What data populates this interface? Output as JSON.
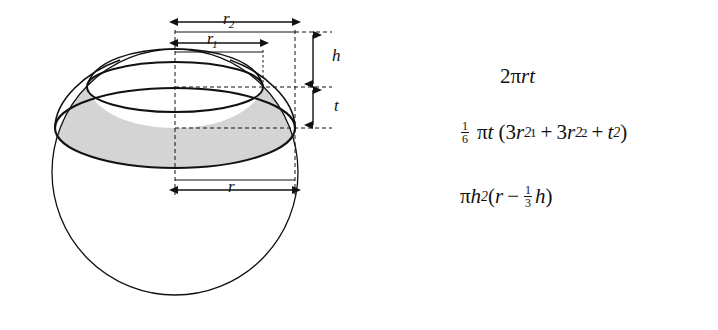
{
  "figure": {
    "background_color": "#ffffff",
    "ink_color": "#111111",
    "shade_color": "#d4d4d4"
  },
  "diagram": {
    "name": "sphere-zone-diagram",
    "sphere": {
      "center_x": 175,
      "center_y": 172,
      "radius": 123
    },
    "upper_circle": {
      "label": "r1",
      "center_x": 175,
      "center_y": 87,
      "semi_major": 88,
      "semi_minor": 25
    },
    "lower_circle": {
      "label": "r2",
      "center_x": 175,
      "center_y": 128,
      "semi_major": 120,
      "semi_minor": 40
    },
    "dimensions": [
      {
        "id": "r2",
        "label": "r",
        "subscript": "2",
        "orientation": "horizontal",
        "y": 22,
        "x_start": 178,
        "x_end": 296
      },
      {
        "id": "r1",
        "label": "r",
        "subscript": "1",
        "orientation": "horizontal",
        "y": 43,
        "x_start": 178,
        "x_end": 264
      },
      {
        "id": "h",
        "label": "h",
        "subscript": "",
        "orientation": "vertical",
        "x": 313,
        "y_start": 52,
        "y_end": 107
      },
      {
        "id": "t",
        "label": "t",
        "subscript": "",
        "orientation": "vertical",
        "x": 313,
        "y_start": 107,
        "y_end": 155
      },
      {
        "id": "r",
        "label": "r",
        "subscript": "",
        "orientation": "horizontal",
        "y": 190,
        "x_start": 178,
        "x_end": 296
      }
    ],
    "labels": {
      "r2": "r",
      "r2_sub": "2",
      "r1": "r",
      "r1_sub": "1",
      "h": "h",
      "t": "t",
      "r": "r"
    }
  },
  "formulas": [
    {
      "id": "lateral-area-zone",
      "plain": "2πrt",
      "tokens": [
        {
          "t": "2",
          "style": "upright"
        },
        {
          "t": "π",
          "style": "upright"
        },
        {
          "t": "r",
          "style": "italic"
        },
        {
          "t": "t",
          "style": "italic"
        }
      ]
    },
    {
      "id": "volume-zone",
      "plain": "1/6 πt (3r₁² + 3r₂² + t²)",
      "fraction": {
        "num": "1",
        "den": "6"
      },
      "tokens": [
        {
          "t": "π",
          "style": "upright"
        },
        {
          "t": "t",
          "style": "italic"
        },
        {
          "t": "(",
          "style": "upright"
        },
        {
          "t": "3",
          "style": "upright"
        },
        {
          "t": "r",
          "style": "italic",
          "sub": "1",
          "sup": "2"
        },
        {
          "t": "+",
          "style": "op"
        },
        {
          "t": "3",
          "style": "upright"
        },
        {
          "t": "r",
          "style": "italic",
          "sub": "2",
          "sup": "2"
        },
        {
          "t": "+",
          "style": "op"
        },
        {
          "t": "t",
          "style": "italic",
          "sup": "2"
        },
        {
          "t": ")",
          "style": "upright"
        }
      ]
    },
    {
      "id": "volume-cap",
      "plain": "πh²(r − 1/3 h)",
      "fraction": {
        "num": "1",
        "den": "3"
      },
      "tokens": [
        {
          "t": "π",
          "style": "upright"
        },
        {
          "t": "h",
          "style": "italic",
          "sup": "2"
        },
        {
          "t": "(",
          "style": "upright"
        },
        {
          "t": "r",
          "style": "italic"
        },
        {
          "t": "−",
          "style": "op"
        },
        {
          "t": "h",
          "style": "italic"
        },
        {
          "t": ")",
          "style": "upright"
        }
      ]
    }
  ],
  "formula_text": {
    "f1_two": "2",
    "f1_pi": "π",
    "f1_r": "r",
    "f1_t": "t",
    "f2_num": "1",
    "f2_den": "6",
    "f2_pi": "π",
    "f2_t": "t",
    "f2_open": "(",
    "f2_three_a": "3",
    "f2_r_a": "r",
    "f2_sub_a": "1",
    "f2_sup_a": "2",
    "f2_plus_a": "+",
    "f2_three_b": "3",
    "f2_r_b": "r",
    "f2_sub_b": "2",
    "f2_sup_b": "2",
    "f2_plus_b": "+",
    "f2_t2": "t",
    "f2_sup_c": "2",
    "f2_close": ")",
    "f3_pi": "π",
    "f3_h": "h",
    "f3_sup_h": "2",
    "f3_open": "(",
    "f3_r": "r",
    "f3_minus": "−",
    "f3_num": "1",
    "f3_den": "3",
    "f3_h2": "h",
    "f3_close": ")"
  }
}
